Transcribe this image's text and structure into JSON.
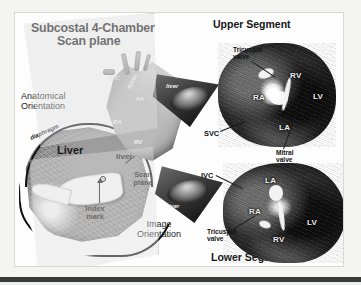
{
  "figure": {
    "title_line1": "Subcostal 4-Chamber",
    "title_line2": "Scan plane",
    "header_upper": "Upper Segment",
    "header_lower": "Lower Segment"
  },
  "panels": {
    "anatomical": {
      "label_line1": "Anatomical",
      "label_line2": "Orientation",
      "liver_large": "Liver",
      "liver_small": "liver",
      "diaphragm": "diaphragm",
      "index_line1": "Index",
      "index_line2": "mark",
      "scan_line1": "Scan",
      "scan_line2": "plane"
    },
    "image_orientation": {
      "label_line1": "Image",
      "label_line2": "Orientation"
    }
  },
  "heart_labels": {
    "aorta": "Aorta",
    "pa": "PA",
    "svc": "SVC",
    "ra": "RA",
    "rv": "RV"
  },
  "wedges": {
    "upper_liver": "liver",
    "lower_liver": "liver"
  },
  "upper_segment": {
    "tricuspid_line1": "Tricuspid",
    "tricuspid_line2": "valve",
    "ra": "RA",
    "rv": "RV",
    "la": "LA",
    "lv": "LV"
  },
  "lower_segment": {
    "tricuspid_line1": "Tricuspid",
    "tricuspid_line2": "valve",
    "ra": "RA",
    "rv": "RV",
    "la": "LA",
    "lv": "LV"
  },
  "vessels": {
    "svc": "SVC",
    "ivc": "IVC",
    "mitral_line1": "Mitral",
    "mitral_line2": "valve"
  },
  "colors": {
    "frame_border": "#d8d8d6",
    "page_background": "#f4f4f3",
    "figure_background": "#fdfdfd",
    "text": "#161616",
    "bottom_rule": "#3a3a3a"
  }
}
